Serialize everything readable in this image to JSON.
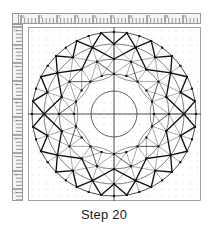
{
  "caption": {
    "text": "Step 20"
  },
  "rulers": {
    "top": {
      "name": "horizontal-ruler",
      "orientation": "horizontal",
      "major_tick_interval_px": 18,
      "minor_tick_interval_px": 3.6,
      "labels": [
        "0",
        "1",
        "2",
        "3",
        "4",
        "5",
        "6",
        "7",
        "8",
        "9",
        "10"
      ],
      "bg_color": "#f4f4f4",
      "tick_color": "#4a4a4a",
      "border_color": "#9a9a9a"
    },
    "left": {
      "name": "vertical-ruler",
      "orientation": "vertical",
      "major_tick_interval_px": 18,
      "minor_tick_interval_px": 3.6,
      "labels": [
        "0",
        "1",
        "2",
        "3",
        "4",
        "5",
        "6",
        "7",
        "8",
        "9"
      ],
      "bg_color": "#f4f4f4",
      "tick_color": "#4a4a4a",
      "border_color": "#9a9a9a"
    }
  },
  "canvas": {
    "name": "drawing-canvas",
    "width": 173,
    "height": 174,
    "background": "#ffffff",
    "border_color": "#8c8c8c",
    "dot_grid": {
      "visible": true,
      "spacing_px": 7.2,
      "dot_color": "#d8c9cc",
      "dot_radius": 0.55
    },
    "axes": {
      "visible": true,
      "color": "#4a4a4a",
      "width": 1,
      "horizontal_y": 87,
      "vertical_x": 86
    }
  },
  "figure": {
    "name": "radial-mandala",
    "type": "polar-construction",
    "center": {
      "x": 86,
      "y": 87
    },
    "sector_count": 20,
    "angle_step_deg": 18,
    "angle_offset_deg": -90,
    "rings": [
      {
        "id": "r-core",
        "radius": 23,
        "stroke": "#3a3a3a",
        "width": 0.8,
        "nodes": false
      },
      {
        "id": "r-inner",
        "radius": 40,
        "stroke": "#4a4a4a",
        "width": 0.7,
        "nodes": true
      },
      {
        "id": "r-mid",
        "radius": 55,
        "stroke": "#4a4a4a",
        "width": 0.7,
        "nodes": true
      },
      {
        "id": "r-outer",
        "radius": 70,
        "stroke": "#4a4a4a",
        "width": 0.7,
        "nodes": true
      },
      {
        "id": "r-rim",
        "radius": 82,
        "stroke": "#3a3a3a",
        "width": 0.9,
        "nodes": true
      }
    ],
    "node": {
      "shape": "square",
      "size_px": 2.1,
      "fill": "#111111"
    },
    "strokes": {
      "heavy": {
        "color": "#111111",
        "width": 1.35
      },
      "light": {
        "color": "#6e6e6e",
        "width": 0.6
      }
    },
    "bands": [
      {
        "id": "band-rim",
        "from_radius": 70,
        "to_radius": 82,
        "pattern": "zigzag-v",
        "emphasis": "heavy",
        "description": "V-shaped spikes alternating between outer ring and rim"
      },
      {
        "id": "band-outer",
        "from_radius": 55,
        "to_radius": 70,
        "pattern": "triangulated-quad",
        "emphasis": "mixed",
        "description": "Trapezoid cells split by diagonals"
      },
      {
        "id": "band-mid",
        "from_radius": 40,
        "to_radius": 55,
        "pattern": "triangulated-quad",
        "emphasis": "light",
        "description": "Trapezoid cells split by diagonals"
      },
      {
        "id": "band-inner",
        "from_radius": 23,
        "to_radius": 40,
        "pattern": "petal-arcs",
        "emphasis": "light",
        "description": "Arc petals joining inner ring nodes around the core circle"
      }
    ]
  }
}
